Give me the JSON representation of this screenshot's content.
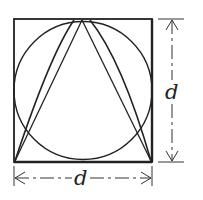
{
  "diagram": {
    "colors": {
      "stroke": "#222222",
      "background": "#ffffff"
    },
    "square": {
      "x": 14,
      "y": 19,
      "width": 138,
      "height": 143
    },
    "circle": {
      "cx": 83,
      "cy": 90.5,
      "r": 69
    },
    "apex": {
      "x": 82,
      "y": 19
    },
    "dimensions": {
      "vertical": {
        "label": "d",
        "x": 172,
        "y_top": 19,
        "y_bottom": 162
      },
      "horizontal": {
        "label": "d",
        "y": 178,
        "x_left": 14,
        "x_right": 152
      }
    }
  }
}
